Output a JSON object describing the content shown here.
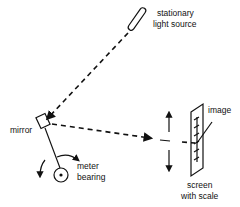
{
  "diagram": {
    "labels": {
      "light_source_line1": "stationary",
      "light_source_line2": "light source",
      "mirror": "mirror",
      "meter_line1": "meter",
      "meter_line2": "bearing",
      "image": "image",
      "screen_line1": "screen",
      "screen_line2": "with scale"
    },
    "icons": [
      "light-source-icon",
      "mirror-icon",
      "bearing-icon",
      "screen-icon",
      "rotation-arrow-icon",
      "up-arrow-icon",
      "down-arrow-icon"
    ],
    "colors": {
      "ink": "#111111",
      "background": "#ffffff"
    }
  }
}
